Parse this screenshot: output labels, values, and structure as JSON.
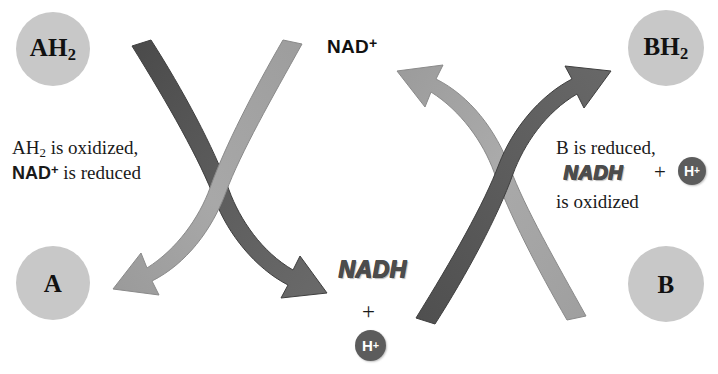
{
  "diagram": {
    "colors": {
      "circle_fill": "#c8c8c8",
      "arrow_dark": "#585858",
      "arrow_light": "#a0a0a0",
      "hplus_fill": "#5c5c5c",
      "text": "#1a1a1a",
      "background": "#ffffff"
    }
  },
  "molecules": {
    "ah2": {
      "label": "AH",
      "sub": "2"
    },
    "a": {
      "label": "A",
      "sub": ""
    },
    "bh2": {
      "label": "BH",
      "sub": "2"
    },
    "b": {
      "label": "B",
      "sub": ""
    }
  },
  "labels": {
    "nad_plus": "NAD",
    "nad_plus_sup": "+",
    "nadh_bottom": "NADH",
    "nadh_right": "NADH",
    "plus_bottom": "+",
    "plus_right": "+",
    "hplus_bottom": "H",
    "hplus_bottom_sup": "+",
    "hplus_right": "H",
    "hplus_right_sup": "+"
  },
  "annotations": {
    "left": {
      "line1_text": "AH",
      "line1_sub": "2",
      "line1_rest": " is oxidized,",
      "line2_bold": "NAD",
      "line2_bold_sup": "+",
      "line2_rest": " is reduced"
    },
    "right": {
      "line1": "B is reduced,",
      "line2_nadh": "NADH",
      "line2_plus": "+",
      "line2_hplus": "H",
      "line2_hplus_sup": "+",
      "line3": "is oxidized"
    }
  },
  "arrows": [
    {
      "name": "ah2-to-nadh",
      "from": "AH2",
      "to": "NADH + H+",
      "shade": "dark",
      "direction": "down-right",
      "group": "left-crossing-pair"
    },
    {
      "name": "nadplus-to-a",
      "from": "NAD+",
      "to": "A",
      "shade": "light",
      "direction": "down-left",
      "group": "left-crossing-pair"
    },
    {
      "name": "nadh-to-nadplus",
      "from": "NADH + H+",
      "to": "NAD+",
      "shade": "light",
      "direction": "up-left",
      "group": "right-crossing-pair"
    },
    {
      "name": "b-to-bh2",
      "from": "B",
      "to": "BH2",
      "shade": "dark",
      "direction": "up-right",
      "group": "right-crossing-pair"
    }
  ]
}
